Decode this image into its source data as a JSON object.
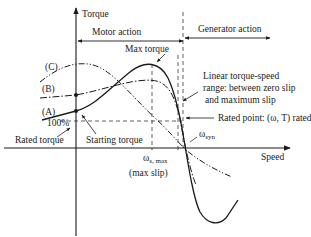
{
  "diagram": {
    "axes": {
      "y_label": "Torque",
      "x_label": "Speed"
    },
    "regions": {
      "motor": "Motor action",
      "generator": "Generator action"
    },
    "curves": [
      {
        "id": "A",
        "label": "(A)",
        "style": "solid"
      },
      {
        "id": "B",
        "label": "(B)",
        "style": "dash-dot"
      },
      {
        "id": "C",
        "label": "(C)",
        "style": "dash-dot-dot"
      }
    ],
    "annotations": {
      "max_torque": "Max torque",
      "linear_range_line1": "Linear torque-speed",
      "linear_range_line2": "range: between zero slip",
      "linear_range_line3": "and maximum slip",
      "rated_point": "Rated point: (ω, T) rated",
      "rated_torque": "Rated torque",
      "hundred_percent": "100%",
      "starting_torque": "Starting torque",
      "omega_syn": "ω",
      "omega_syn_sub": "syn",
      "omega_smax": "ω",
      "omega_smax_sub": "s, max",
      "max_slip": "(max slip)"
    },
    "colors": {
      "line": "#1a1a1a",
      "background": "#ffffff"
    }
  }
}
